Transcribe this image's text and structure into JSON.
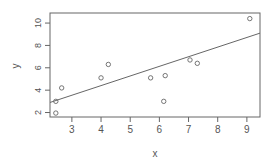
{
  "chart_data": {
    "type": "scatter",
    "title": "",
    "xlabel": "x",
    "ylabel": "y",
    "xlim": [
      2.25,
      9.45
    ],
    "ylim": [
      1.6,
      10.9
    ],
    "grid": false,
    "legend": null,
    "x_ticks": [
      3,
      4,
      5,
      6,
      7,
      8,
      9
    ],
    "y_ticks": [
      2,
      4,
      6,
      8,
      10
    ],
    "points": [
      {
        "x": 2.45,
        "y": 1.95
      },
      {
        "x": 2.45,
        "y": 3.0
      },
      {
        "x": 2.65,
        "y": 4.2
      },
      {
        "x": 4.0,
        "y": 5.1
      },
      {
        "x": 4.25,
        "y": 6.3
      },
      {
        "x": 5.7,
        "y": 5.1
      },
      {
        "x": 6.2,
        "y": 5.3
      },
      {
        "x": 6.15,
        "y": 3.0
      },
      {
        "x": 7.05,
        "y": 6.7
      },
      {
        "x": 7.3,
        "y": 6.4
      },
      {
        "x": 9.1,
        "y": 10.4
      }
    ],
    "fit_line": {
      "x0": 2.25,
      "y0": 2.9,
      "x1": 9.45,
      "y1": 9.1
    },
    "colors": {
      "axis": "#666666",
      "points": "#666666",
      "line": "#666666",
      "background": "#ffffff"
    }
  }
}
